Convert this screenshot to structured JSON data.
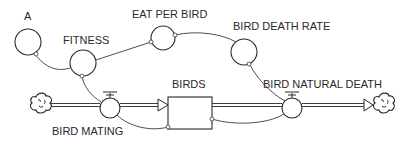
{
  "diagram": {
    "type": "stock-and-flow",
    "stocks": [
      {
        "id": "birds",
        "label": "BIRDS"
      }
    ],
    "flows": [
      {
        "id": "bird_mating",
        "label": "BIRD MATING",
        "from": "source-cloud",
        "to": "birds"
      },
      {
        "id": "bird_natural_death",
        "label": "BIRD NATURAL DEATH",
        "from": "birds",
        "to": "sink-cloud"
      }
    ],
    "auxiliaries": [
      {
        "id": "a",
        "label": "A"
      },
      {
        "id": "fitness",
        "label": "FITNESS"
      },
      {
        "id": "eat_per_bird",
        "label": "EAT PER BIRD"
      },
      {
        "id": "bird_death_rate",
        "label": "BIRD DEATH RATE"
      }
    ],
    "connectors": [
      {
        "from": "a",
        "to": "fitness"
      },
      {
        "from": "fitness",
        "to": "eat_per_bird"
      },
      {
        "from": "eat_per_bird",
        "to": "bird_death_rate"
      },
      {
        "from": "fitness",
        "to": "bird_mating"
      },
      {
        "from": "bird_death_rate",
        "to": "bird_natural_death"
      },
      {
        "from": "birds",
        "to": "bird_mating"
      },
      {
        "from": "birds",
        "to": "bird_natural_death"
      }
    ],
    "clouds": [
      {
        "id": "source-cloud",
        "role": "source"
      },
      {
        "id": "sink-cloud",
        "role": "sink"
      }
    ]
  }
}
